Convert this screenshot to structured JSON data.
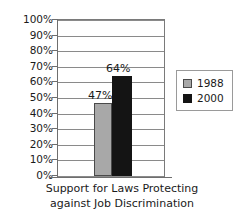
{
  "chart_data": {
    "type": "bar",
    "title": "",
    "caption_line1": "Support for Laws Protecting",
    "caption_line2": "against Job Discrimination",
    "categories": [
      "Support for Laws Protecting against Job Discrimination"
    ],
    "series": [
      {
        "name": "1988",
        "values": [
          47
        ],
        "color": "#a8a8a8",
        "data_labels": [
          "47%"
        ]
      },
      {
        "name": "2000",
        "values": [
          64
        ],
        "color": "#141414",
        "data_labels": [
          "64%"
        ]
      }
    ],
    "xlabel": "",
    "ylabel": "",
    "ylim": [
      0,
      100
    ],
    "y_ticks": [
      100,
      90,
      80,
      70,
      60,
      50,
      40,
      30,
      20,
      10,
      0
    ],
    "y_tick_labels": [
      "100%",
      "90%",
      "80%",
      "70%",
      "60%",
      "50%",
      "40%",
      "30%",
      "20%",
      "10%",
      "0%"
    ],
    "grid": true,
    "legend_position": "right",
    "legend_entries": [
      "1988",
      "2000"
    ]
  },
  "legend": {
    "entries": [
      {
        "label": "1988",
        "color": "#a8a8a8"
      },
      {
        "label": "2000",
        "color": "#141414"
      }
    ]
  },
  "caption": {
    "line1": "Support for Laws Protecting",
    "line2": "against Job Discrimination"
  }
}
